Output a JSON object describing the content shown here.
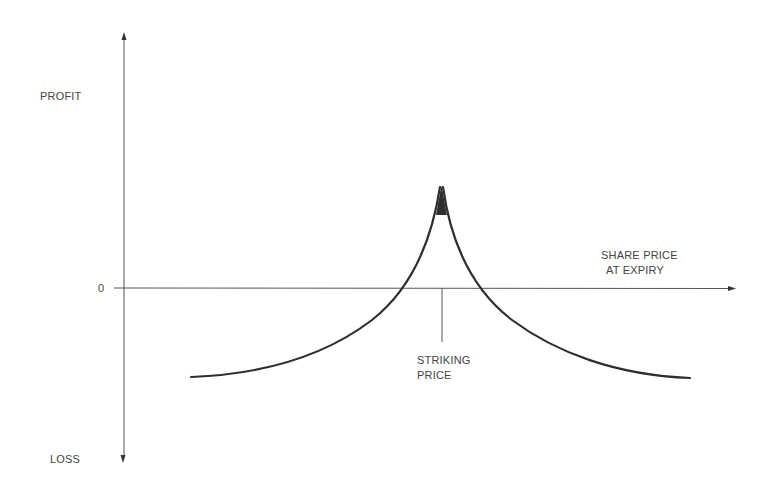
{
  "diagram": {
    "type": "option-payoff",
    "labels": {
      "y_positive": "PROFIT",
      "y_negative": "LOSS",
      "origin": "0",
      "x_axis_line1": "SHARE PRICE",
      "x_axis_line2": "AT EXPIRY",
      "strike_line1": "STRIKING",
      "strike_line2": "PRICE"
    },
    "colors": {
      "axis": "#555555",
      "curve": "#2e2e2e",
      "text": "#444444"
    },
    "geometry": {
      "y_axis_x": 124,
      "y_axis_top": 33,
      "y_axis_bottom": 462,
      "x_axis_y": 288,
      "x_axis_left": 114,
      "x_axis_right": 735,
      "strike_x": 442,
      "strike_tick_bottom": 342,
      "peak": [
        442,
        187
      ],
      "left_end": [
        191,
        377
      ],
      "right_end": [
        690,
        378
      ],
      "zero_crossings": [
        400,
        482
      ]
    }
  }
}
